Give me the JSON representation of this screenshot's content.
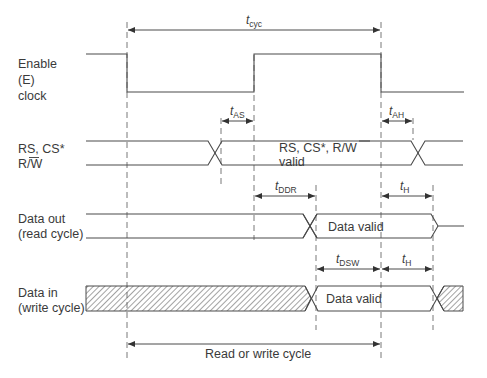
{
  "diagram": {
    "type": "timing-diagram",
    "signals": [
      {
        "id": "enable",
        "label_lines": [
          "Enable",
          "(E)",
          "clock"
        ]
      },
      {
        "id": "rs",
        "label_lines": [
          "RS, CS*",
          "R/W"
        ],
        "overline_text": "W"
      },
      {
        "id": "data_out",
        "label_lines": [
          "Data out",
          "(read cycle)"
        ]
      },
      {
        "id": "data_in",
        "label_lines": [
          "Data in",
          "(write cycle)"
        ]
      }
    ],
    "bus_labels": {
      "rs_valid_line1": "RS, CS*, R/",
      "rs_valid_overline": "W",
      "rs_valid_line2": "valid",
      "data_out_valid": "Data valid",
      "data_in_valid": "Data valid"
    },
    "timing_params": {
      "tcyc": {
        "t": "t",
        "sub": "cyc"
      },
      "tas": {
        "t": "t",
        "sub": "AS"
      },
      "tah": {
        "t": "t",
        "sub": "AH"
      },
      "tddr": {
        "t": "t",
        "sub": "DDR"
      },
      "th1": {
        "t": "t",
        "sub": "H"
      },
      "tdsw": {
        "t": "t",
        "sub": "DSW"
      },
      "th2": {
        "t": "t",
        "sub": "H"
      }
    },
    "bottom_label": "Read or write cycle"
  }
}
